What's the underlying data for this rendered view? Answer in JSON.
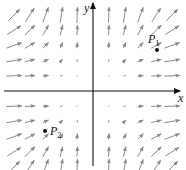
{
  "diagram": {
    "type": "vector-field",
    "field_description": "F(x, y) = (x^2, y^2)",
    "axes": {
      "x_label": "x",
      "y_label": "y",
      "origin_px": [
        93,
        91
      ]
    },
    "grid": {
      "columns": [
        -5,
        -4,
        -3,
        -2,
        -1,
        1,
        2,
        3,
        4,
        5
      ],
      "rows": [
        5,
        4,
        3,
        2,
        1,
        -1,
        -2,
        -3,
        -4,
        -5
      ]
    },
    "points": [
      {
        "label": "P",
        "subscript": "1",
        "position": "upper-right quadrant",
        "px": [
          157,
          50
        ]
      },
      {
        "label": "P",
        "subscript": "2",
        "position": "lower-left quadrant",
        "px": [
          45,
          131
        ]
      }
    ],
    "colors": {
      "arrow": "#8a8a8a",
      "axis": "#111111",
      "point": "#111111"
    }
  }
}
